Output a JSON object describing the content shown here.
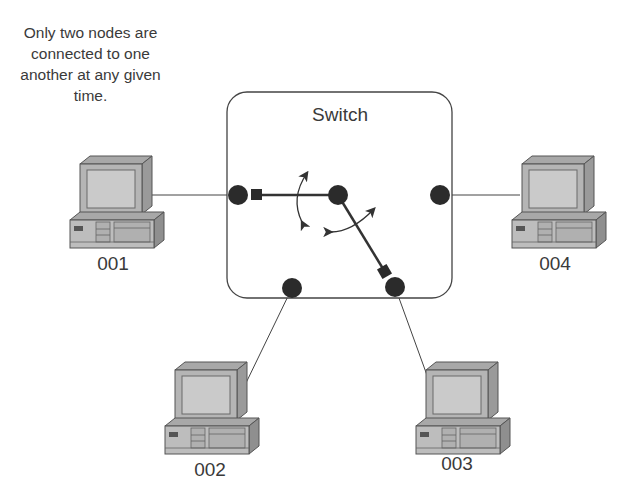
{
  "caption": {
    "lines": [
      "Only two nodes are",
      "connected to one",
      "another at any given",
      "time."
    ]
  },
  "switch": {
    "title": "Switch",
    "ports": [
      {
        "id": "port-left",
        "cx": 238,
        "cy": 195
      },
      {
        "id": "port-center",
        "cx": 338,
        "cy": 195
      },
      {
        "id": "port-right",
        "cx": 440,
        "cy": 195
      },
      {
        "id": "port-bottom-left",
        "cx": 292,
        "cy": 288
      },
      {
        "id": "port-bottom-right",
        "cx": 395,
        "cy": 287
      }
    ],
    "active_connection": "001 ↔ 003"
  },
  "computers": [
    {
      "label": "001",
      "position": "left"
    },
    {
      "label": "002",
      "position": "bottom-left"
    },
    {
      "label": "003",
      "position": "bottom-right"
    },
    {
      "label": "004",
      "position": "right"
    }
  ],
  "colors": {
    "line": "#3a3a3a",
    "port": "#2b2b2b",
    "pc_body": "#b8b8b8",
    "pc_dark": "#8f8f8f",
    "pc_screen": "#c9c9c9"
  }
}
